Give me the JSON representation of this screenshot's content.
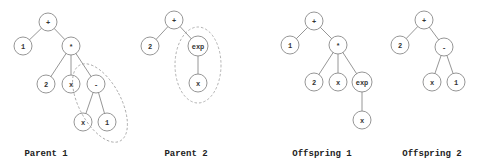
{
  "diagram": {
    "node_radius": 9,
    "colors": {
      "stroke": "#8a8a8a",
      "text": "#333333",
      "selection": "#a0a0a0",
      "caption": "#222222"
    },
    "trees": [
      {
        "id": "parent-1",
        "caption": "Parent 1",
        "caption_pos": [
          46,
          156
        ],
        "nodes": [
          {
            "id": "p1n0",
            "label": "+",
            "x": 48,
            "y": 22
          },
          {
            "id": "p1n1",
            "label": "1",
            "x": 23,
            "y": 46
          },
          {
            "id": "p1n2",
            "label": "*",
            "x": 71,
            "y": 46
          },
          {
            "id": "p1n3",
            "label": "2",
            "x": 46,
            "y": 84
          },
          {
            "id": "p1n4",
            "label": "x",
            "x": 71,
            "y": 84
          },
          {
            "id": "p1n5",
            "label": "-",
            "x": 96,
            "y": 84
          },
          {
            "id": "p1n6",
            "label": "x",
            "x": 83,
            "y": 122
          },
          {
            "id": "p1n7",
            "label": "1",
            "x": 107,
            "y": 122
          }
        ],
        "edges": [
          [
            "p1n0",
            "p1n1"
          ],
          [
            "p1n0",
            "p1n2"
          ],
          [
            "p1n2",
            "p1n3"
          ],
          [
            "p1n2",
            "p1n4"
          ],
          [
            "p1n2",
            "p1n5"
          ],
          [
            "p1n5",
            "p1n6"
          ],
          [
            "p1n5",
            "p1n7"
          ]
        ],
        "selection": {
          "cx": 100,
          "cy": 103,
          "rx": 21,
          "ry": 43,
          "rotate": 28
        }
      },
      {
        "id": "parent-2",
        "caption": "Parent 2",
        "caption_pos": [
          186,
          156
        ],
        "nodes": [
          {
            "id": "p2n0",
            "label": "+",
            "x": 174,
            "y": 20
          },
          {
            "id": "p2n1",
            "label": "2",
            "x": 150,
            "y": 46
          },
          {
            "id": "p2n2",
            "label": "exp",
            "x": 198,
            "y": 46
          },
          {
            "id": "p2n3",
            "label": "x",
            "x": 198,
            "y": 83
          }
        ],
        "edges": [
          [
            "p2n0",
            "p2n1"
          ],
          [
            "p2n0",
            "p2n2"
          ],
          [
            "p2n2",
            "p2n3"
          ]
        ],
        "selection": {
          "cx": 198,
          "cy": 65,
          "rx": 23,
          "ry": 38,
          "rotate": 0
        }
      },
      {
        "id": "offspring-1",
        "caption": "Offspring 1",
        "caption_pos": [
          322,
          156
        ],
        "nodes": [
          {
            "id": "o1n0",
            "label": "+",
            "x": 314,
            "y": 21
          },
          {
            "id": "o1n1",
            "label": "1",
            "x": 290,
            "y": 45
          },
          {
            "id": "o1n2",
            "label": "*",
            "x": 338,
            "y": 45
          },
          {
            "id": "o1n3",
            "label": "2",
            "x": 314,
            "y": 82
          },
          {
            "id": "o1n4",
            "label": "x",
            "x": 338,
            "y": 82
          },
          {
            "id": "o1n5",
            "label": "exp",
            "x": 362,
            "y": 82
          },
          {
            "id": "o1n6",
            "label": "x",
            "x": 362,
            "y": 120
          }
        ],
        "edges": [
          [
            "o1n0",
            "o1n1"
          ],
          [
            "o1n0",
            "o1n2"
          ],
          [
            "o1n2",
            "o1n3"
          ],
          [
            "o1n2",
            "o1n4"
          ],
          [
            "o1n2",
            "o1n5"
          ],
          [
            "o1n5",
            "o1n6"
          ]
        ],
        "selection": null
      },
      {
        "id": "offspring-2",
        "caption": "Offspring 2",
        "caption_pos": [
          432,
          156
        ],
        "nodes": [
          {
            "id": "o2n0",
            "label": "+",
            "x": 424,
            "y": 20
          },
          {
            "id": "o2n1",
            "label": "2",
            "x": 400,
            "y": 45
          },
          {
            "id": "o2n2",
            "label": "-",
            "x": 444,
            "y": 47
          },
          {
            "id": "o2n3",
            "label": "x",
            "x": 432,
            "y": 82
          },
          {
            "id": "o2n4",
            "label": "1",
            "x": 456,
            "y": 82
          }
        ],
        "edges": [
          [
            "o2n0",
            "o2n1"
          ],
          [
            "o2n0",
            "o2n2"
          ],
          [
            "o2n2",
            "o2n3"
          ],
          [
            "o2n2",
            "o2n4"
          ]
        ],
        "selection": null
      }
    ]
  }
}
